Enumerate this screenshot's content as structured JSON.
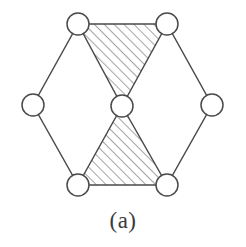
{
  "figure": {
    "caption": "(a)",
    "background_color": "#ffffff",
    "line_color": "#4a4a4a",
    "node_fill_color": "#ffffff",
    "hatch_color": "#5a5a5a",
    "caption_color": "#3a3a3a"
  },
  "chart_data": {
    "type": "diagram",
    "title": "(a)",
    "node_radius": 11,
    "nodes": [
      {
        "id": "top-left",
        "label": "",
        "x": 78,
        "y": 24
      },
      {
        "id": "top-right",
        "label": "",
        "x": 167,
        "y": 24
      },
      {
        "id": "left",
        "label": "",
        "x": 33,
        "y": 105
      },
      {
        "id": "center",
        "label": "",
        "x": 122,
        "y": 106
      },
      {
        "id": "right",
        "label": "",
        "x": 212,
        "y": 105
      },
      {
        "id": "bottom-left",
        "label": "",
        "x": 78,
        "y": 185
      },
      {
        "id": "bottom-right",
        "label": "",
        "x": 167,
        "y": 185
      }
    ],
    "edges": [
      {
        "from": "top-left",
        "to": "top-right"
      },
      {
        "from": "top-left",
        "to": "left"
      },
      {
        "from": "left",
        "to": "bottom-left"
      },
      {
        "from": "bottom-left",
        "to": "bottom-right"
      },
      {
        "from": "bottom-right",
        "to": "right"
      },
      {
        "from": "right",
        "to": "top-right"
      },
      {
        "from": "top-left",
        "to": "center"
      },
      {
        "from": "top-right",
        "to": "center"
      },
      {
        "from": "bottom-left",
        "to": "center"
      },
      {
        "from": "bottom-right",
        "to": "center"
      }
    ],
    "shaded_faces": [
      {
        "id": "upper-triangle",
        "vertices": [
          "top-left",
          "top-right",
          "center"
        ],
        "fill": "diagonal-hatch"
      },
      {
        "id": "lower-triangle",
        "vertices": [
          "center",
          "bottom-left",
          "bottom-right"
        ],
        "fill": "diagonal-hatch"
      }
    ],
    "hatch": {
      "angle_degrees": 45,
      "spacing": 7,
      "stroke_width": 1.1
    }
  }
}
